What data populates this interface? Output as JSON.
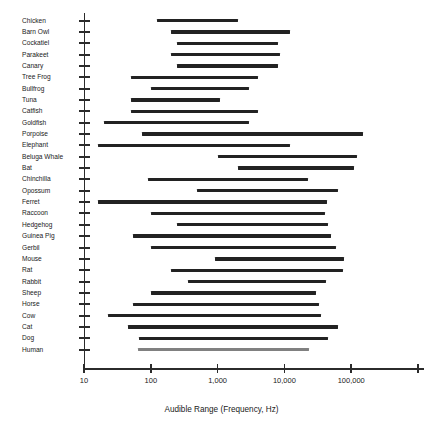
{
  "chart_data": {
    "type": "bar",
    "orientation": "horizontal",
    "subtype": "range-bar",
    "title": "",
    "xlabel": "Audible Range (Frequency, Hz)",
    "ylabel": "",
    "xscale": "log",
    "xlim": [
      10,
      1000000
    ],
    "grid": false,
    "legend": null,
    "xticks": [
      10,
      100,
      1000,
      10000,
      100000,
      1000000
    ],
    "xtick_labels": [
      "10",
      "100",
      "1,000",
      "10,000",
      "100,000",
      ""
    ],
    "categories": [
      "Chicken",
      "Barn Owl",
      "Cockatiel",
      "Parakeet",
      "Canary",
      "Tree Frog",
      "Bullfrog",
      "Tuna",
      "Catfish",
      "Goldfish",
      "Porpoise",
      "Elephant",
      "Beluga Whale",
      "Bat",
      "Chinchilla",
      "Opossum",
      "Ferret",
      "Raccoon",
      "Hedgehog",
      "Guinea Pig",
      "Gerbil",
      "Mouse",
      "Rat",
      "Rabbit",
      "Sheep",
      "Horse",
      "Cow",
      "Cat",
      "Dog",
      "Human"
    ],
    "bar_color": "#222222",
    "highlight_color": "#808080",
    "ranges": [
      {
        "label": "Chicken",
        "low": 125,
        "high": 2000,
        "color": "#222222"
      },
      {
        "label": "Barn Owl",
        "low": 200,
        "high": 12000,
        "color": "#222222"
      },
      {
        "label": "Cockatiel",
        "low": 250,
        "high": 8000,
        "color": "#222222"
      },
      {
        "label": "Parakeet",
        "low": 200,
        "high": 8500,
        "color": "#222222"
      },
      {
        "label": "Canary",
        "low": 250,
        "high": 8000,
        "color": "#222222"
      },
      {
        "label": "Tree Frog",
        "low": 50,
        "high": 4000,
        "color": "#222222"
      },
      {
        "label": "Bullfrog",
        "low": 100,
        "high": 3000,
        "color": "#222222"
      },
      {
        "label": "Tuna",
        "low": 50,
        "high": 1100,
        "color": "#222222"
      },
      {
        "label": "Catfish",
        "low": 50,
        "high": 4000,
        "color": "#222222"
      },
      {
        "label": "Goldfish",
        "low": 20,
        "high": 3000,
        "color": "#222222"
      },
      {
        "label": "Porpoise",
        "low": 75,
        "high": 150000,
        "color": "#222222"
      },
      {
        "label": "Elephant",
        "low": 16,
        "high": 12000,
        "color": "#222222"
      },
      {
        "label": "Beluga Whale",
        "low": 1000,
        "high": 123000,
        "color": "#222222"
      },
      {
        "label": "Bat",
        "low": 2000,
        "high": 110000,
        "color": "#222222"
      },
      {
        "label": "Chinchilla",
        "low": 90,
        "high": 22500,
        "color": "#222222"
      },
      {
        "label": "Opossum",
        "low": 500,
        "high": 64000,
        "color": "#222222"
      },
      {
        "label": "Ferret",
        "low": 16,
        "high": 44000,
        "color": "#222222"
      },
      {
        "label": "Raccoon",
        "low": 100,
        "high": 40000,
        "color": "#222222"
      },
      {
        "label": "Hedgehog",
        "low": 250,
        "high": 45000,
        "color": "#222222"
      },
      {
        "label": "Guinea Pig",
        "low": 54,
        "high": 50000,
        "color": "#222222"
      },
      {
        "label": "Gerbil",
        "low": 100,
        "high": 60000,
        "color": "#222222"
      },
      {
        "label": "Mouse",
        "low": 900,
        "high": 79000,
        "color": "#222222"
      },
      {
        "label": "Rat",
        "low": 200,
        "high": 76000,
        "color": "#222222"
      },
      {
        "label": "Rabbit",
        "low": 360,
        "high": 42000,
        "color": "#222222"
      },
      {
        "label": "Sheep",
        "low": 100,
        "high": 30000,
        "color": "#222222"
      },
      {
        "label": "Horse",
        "low": 55,
        "high": 33500,
        "color": "#222222"
      },
      {
        "label": "Cow",
        "low": 23,
        "high": 35000,
        "color": "#222222"
      },
      {
        "label": "Cat",
        "low": 45,
        "high": 64000,
        "color": "#222222"
      },
      {
        "label": "Dog",
        "low": 67,
        "high": 45000,
        "color": "#222222"
      },
      {
        "label": "Human",
        "low": 64,
        "high": 23000,
        "color": "#808080"
      }
    ]
  },
  "axis": {
    "x_title": "Audible Range (Frequency, Hz)",
    "tick_labels": [
      "10",
      "100",
      "1,000",
      "10,000",
      "100,000",
      ""
    ]
  }
}
